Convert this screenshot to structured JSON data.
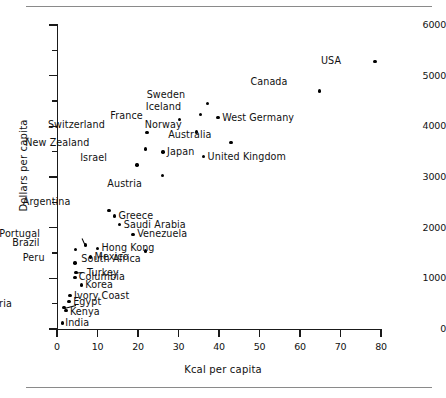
{
  "figure": {
    "has_top_rule": true,
    "has_bottom_rule": true
  },
  "chart_data": {
    "type": "scatter",
    "title": "",
    "xlabel": "Kcal per capita",
    "ylabel": "Dollars per capita",
    "xlim": [
      0,
      80
    ],
    "ylim": [
      0,
      6000
    ],
    "xticks": [
      0,
      10,
      20,
      30,
      40,
      50,
      60,
      70,
      80
    ],
    "yticks": [
      0,
      1000,
      2000,
      3000,
      4000,
      5000,
      6000
    ],
    "y_minor_ticks": [
      500,
      1500,
      2500,
      3500,
      4500,
      5500
    ],
    "grid": false,
    "legend": null,
    "marker": "filled-circle",
    "points": [
      {
        "label": "USA",
        "x": 78.5,
        "y": 5280,
        "lx": -34,
        "ly": -5
      },
      {
        "label": "Canada",
        "x": 64.8,
        "y": 4700,
        "lx": -32,
        "ly": -14
      },
      {
        "label": "Sweden",
        "x": 37.2,
        "y": 4450,
        "lx": -22,
        "ly": -14
      },
      {
        "label": "Iceland",
        "x": 35.5,
        "y": 4230,
        "lx": -20,
        "ly": -13
      },
      {
        "label": "West Germany",
        "x": 39.8,
        "y": 4170,
        "lx": 4,
        "ly": -5
      },
      {
        "label": "France",
        "x": 30.2,
        "y": 4130,
        "lx": -36,
        "ly": -9
      },
      {
        "label": "Norway",
        "x": 34.5,
        "y": 3890,
        "lx": -15,
        "ly": -12
      },
      {
        "label": "Switzerland",
        "x": 22.2,
        "y": 3880,
        "lx": -42,
        "ly": -12
      },
      {
        "label": "Australia",
        "x": 43.0,
        "y": 3680,
        "lx": -20,
        "ly": -13
      },
      {
        "label": "New Zealand",
        "x": 21.8,
        "y": 3550,
        "lx": -56,
        "ly": -11
      },
      {
        "label": "Japan",
        "x": 26.2,
        "y": 3490,
        "lx": 4,
        "ly": -5
      },
      {
        "label": "United Kingdom",
        "x": 36.2,
        "y": 3400,
        "lx": 4,
        "ly": -5
      },
      {
        "label": "Israel",
        "x": 19.8,
        "y": 3240,
        "lx": -30,
        "ly": -12
      },
      {
        "label": "Austria",
        "x": 26.0,
        "y": 3030,
        "lx": -20,
        "ly": 4
      },
      {
        "label": "Argentina",
        "x": 12.8,
        "y": 2340,
        "lx": -38,
        "ly": -13
      },
      {
        "label": "Greece",
        "x": 14.2,
        "y": 2230,
        "lx": 4,
        "ly": -5
      },
      {
        "label": "Saudi Arabia",
        "x": 15.5,
        "y": 2060,
        "lx": 4,
        "ly": -5
      },
      {
        "label": "Venezuela",
        "x": 18.8,
        "y": 1870,
        "lx": 4,
        "ly": -5
      },
      {
        "label": "Portugal",
        "x": 7.0,
        "y": 1660,
        "lx": -45,
        "ly": -16
      },
      {
        "label": "Brazil",
        "x": 4.5,
        "y": 1570,
        "lx": -36,
        "ly": -11
      },
      {
        "label": "Hong Kong",
        "x": 10.0,
        "y": 1590,
        "lx": 4,
        "ly": -5
      },
      {
        "label": "South Africa",
        "x": 21.8,
        "y": 1540,
        "lx": -4,
        "ly": 3
      },
      {
        "label": "Mexico",
        "x": 8.3,
        "y": 1420,
        "lx": 4,
        "ly": -5
      },
      {
        "label": "Peru",
        "x": 4.4,
        "y": 1300,
        "lx": -30,
        "ly": -10
      },
      {
        "label": "Turkey",
        "x": 4.7,
        "y": 1120,
        "lx": 11,
        "ly": -4
      },
      {
        "label": "Columbia",
        "x": 4.4,
        "y": 1020,
        "lx": 4,
        "ly": -5
      },
      {
        "label": "Korea",
        "x": 6.0,
        "y": 870,
        "lx": 4,
        "ly": -5
      },
      {
        "label": "Ivory Coast",
        "x": 3.2,
        "y": 660,
        "lx": 4,
        "ly": -5
      },
      {
        "label": "Egypt",
        "x": 3.0,
        "y": 540,
        "lx": 4,
        "ly": -5
      },
      {
        "label": "Nigeria",
        "x": 1.7,
        "y": 420,
        "lx": -52,
        "ly": -9
      },
      {
        "label": "Kenya",
        "x": 2.2,
        "y": 360,
        "lx": 4,
        "ly": -4
      },
      {
        "label": "India",
        "x": 1.3,
        "y": 120,
        "lx": 3,
        "ly": -5
      }
    ],
    "leader_lines": [
      {
        "label": "Nigeria",
        "from_x": 4.6,
        "from_y": 480,
        "to_x": 1.7,
        "to_y": 420
      },
      {
        "label": "Portugal",
        "from_x": 6.2,
        "from_y": 1800,
        "to_x": 7.0,
        "to_y": 1660
      },
      {
        "label": "Turkey",
        "from_x": 6.3,
        "from_y": 1130,
        "to_x": 4.7,
        "to_y": 1120
      }
    ]
  }
}
